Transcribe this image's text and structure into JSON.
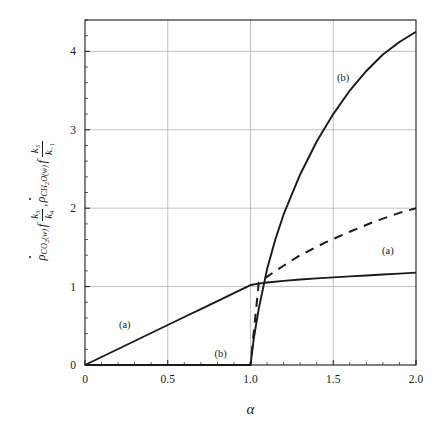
{
  "chart_data": {
    "type": "line",
    "title": "",
    "xlabel": "α",
    "ylabel": "ρ̇_CO2(w) f k3/k4 , ρ̇_CH2O(w) f k3/k-1",
    "xlim": [
      0,
      2.0
    ],
    "ylim": [
      0,
      4.4
    ],
    "xticks": [
      "0",
      "0.5",
      "1.0",
      "1.5",
      "2.0"
    ],
    "xtick_values": [
      0,
      0.5,
      1.0,
      1.5,
      2.0
    ],
    "yticks": [
      "0",
      "1",
      "2",
      "3",
      "4"
    ],
    "ytick_values": [
      0,
      1,
      2,
      3,
      4
    ],
    "grid": true,
    "grid_color": "#b3b3b3",
    "legend_position": "inline-annotations",
    "series": [
      {
        "name": "(a) solid",
        "style": "solid",
        "color": "#1a1a1a",
        "label": "(a)",
        "x": [
          0,
          0.1,
          0.2,
          0.3,
          0.4,
          0.5,
          0.6,
          0.7,
          0.8,
          0.9,
          1.0,
          1.05,
          1.1,
          1.2,
          1.3,
          1.4,
          1.5,
          1.6,
          1.7,
          1.8,
          1.9,
          2.0
        ],
        "y": [
          0,
          0.102,
          0.204,
          0.306,
          0.408,
          0.51,
          0.612,
          0.714,
          0.816,
          0.918,
          1.02,
          1.038,
          1.052,
          1.073,
          1.09,
          1.105,
          1.118,
          1.13,
          1.142,
          1.154,
          1.166,
          1.178
        ]
      },
      {
        "name": "(b) solid",
        "style": "solid",
        "color": "#1a1a1a",
        "label": "(b)",
        "x": [
          0,
          0.2,
          0.4,
          0.6,
          0.8,
          1.0,
          1.0,
          1.02,
          1.05,
          1.1,
          1.15,
          1.2,
          1.3,
          1.4,
          1.5,
          1.6,
          1.7,
          1.8,
          1.9,
          2.0
        ],
        "y": [
          0,
          0,
          0,
          0,
          0,
          0,
          0.0,
          0.34,
          0.72,
          1.22,
          1.6,
          1.92,
          2.43,
          2.85,
          3.2,
          3.5,
          3.75,
          3.96,
          4.12,
          4.25
        ]
      },
      {
        "name": "(b) dashed",
        "style": "dashed",
        "color": "#1a1a1a",
        "label": "",
        "x": [
          0,
          0.2,
          0.4,
          0.6,
          0.8,
          1.0,
          1.05,
          1.15,
          1.3,
          1.45,
          1.6,
          1.75,
          1.9,
          2.0
        ],
        "y": [
          0,
          0,
          0,
          0,
          0,
          0,
          1.05,
          1.2,
          1.4,
          1.56,
          1.7,
          1.83,
          1.94,
          2.0
        ]
      }
    ],
    "annotations": [
      {
        "text": "(a)",
        "x": 0.24,
        "y": 0.47,
        "name": "curve-label-a-left"
      },
      {
        "text": "(b)",
        "x": 0.82,
        "y": 0.1,
        "name": "curve-label-b-bottom"
      },
      {
        "text": "(b)",
        "x": 1.56,
        "y": 3.62,
        "name": "curve-label-b-top"
      },
      {
        "text": "(a)",
        "x": 1.83,
        "y": 1.41,
        "name": "curve-label-a-right"
      }
    ]
  },
  "axis": {
    "x_title": "α",
    "y_expression": {
      "rho1": "ρ",
      "rho1_sub_main": "CO",
      "rho1_sub_num": "2",
      "rho1_sub_tail": "(w)",
      "f1": "f",
      "frac1_num": "k",
      "frac1_num_sub": "3",
      "frac1_den": "k",
      "frac1_den_sub": "4",
      "comma": ",",
      "rho2": "ρ",
      "rho2_sub_main": "CH",
      "rho2_sub_num": "2",
      "rho2_sub_tail": "O(w)",
      "f2": "f",
      "frac2_num": "k",
      "frac2_num_sub": "3",
      "frac2_den": "k",
      "frac2_den_sub": "−1"
    }
  },
  "ticks": {
    "x": [
      "0",
      "0.5",
      "1.0",
      "1.5",
      "2.0"
    ],
    "y": [
      "0",
      "1",
      "2",
      "3",
      "4"
    ]
  },
  "colors": {
    "line": "#1a1a1a",
    "grid": "#b3b3b3",
    "frame": "#1a1a1a",
    "background": "#ffffff"
  }
}
